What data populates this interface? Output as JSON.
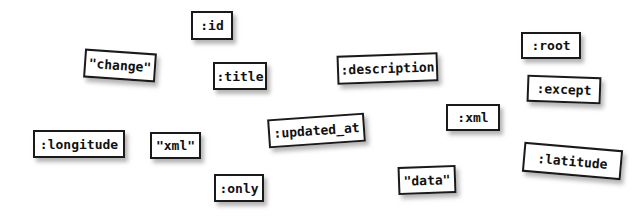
{
  "canvas": {
    "width": 641,
    "height": 217,
    "background": "#ffffff",
    "box_fill": "#ffffff",
    "box_border": "#1a1a1a",
    "text_color": "#111111",
    "shadow_color": "rgba(120,120,120,0.55)"
  },
  "labels": [
    {
      "text": ":id",
      "x": 191,
      "y": 11,
      "w": 42,
      "h": 29,
      "rotate": 0,
      "font_size": 13
    },
    {
      "text": "\"change\"",
      "x": 84,
      "y": 51,
      "w": 72,
      "h": 29,
      "rotate": 4,
      "font_size": 13
    },
    {
      "text": ":title",
      "x": 213,
      "y": 62,
      "w": 54,
      "h": 28,
      "rotate": 0,
      "font_size": 13
    },
    {
      "text": ":description",
      "x": 337,
      "y": 54,
      "w": 101,
      "h": 29,
      "rotate": -2,
      "font_size": 13
    },
    {
      "text": ":root",
      "x": 521,
      "y": 32,
      "w": 60,
      "h": 27,
      "rotate": 0,
      "font_size": 13
    },
    {
      "text": ":except",
      "x": 527,
      "y": 76,
      "w": 74,
      "h": 27,
      "rotate": 2,
      "font_size": 13
    },
    {
      "text": ":xml",
      "x": 446,
      "y": 104,
      "w": 54,
      "h": 27,
      "rotate": 0,
      "font_size": 13
    },
    {
      "text": ":updated_at",
      "x": 268,
      "y": 116,
      "w": 97,
      "h": 29,
      "rotate": -4,
      "font_size": 13
    },
    {
      "text": ":longitude",
      "x": 33,
      "y": 130,
      "w": 92,
      "h": 28,
      "rotate": 0,
      "font_size": 13
    },
    {
      "text": "\"xml\"",
      "x": 150,
      "y": 132,
      "w": 51,
      "h": 27,
      "rotate": 0,
      "font_size": 13
    },
    {
      "text": ":latitude",
      "x": 523,
      "y": 146,
      "w": 99,
      "h": 30,
      "rotate": 5,
      "font_size": 13
    },
    {
      "text": ":only",
      "x": 214,
      "y": 174,
      "w": 50,
      "h": 28,
      "rotate": 0,
      "font_size": 13
    },
    {
      "text": "\"data\"",
      "x": 398,
      "y": 166,
      "w": 58,
      "h": 28,
      "rotate": -2,
      "font_size": 13
    }
  ]
}
